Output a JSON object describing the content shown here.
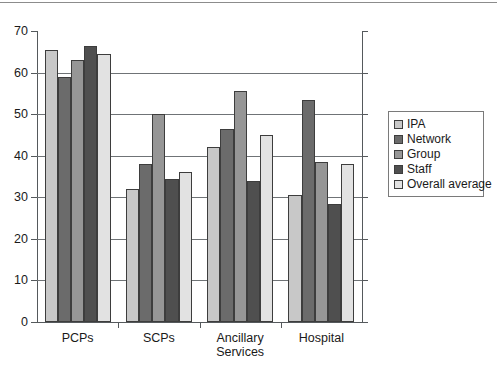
{
  "chart_data": {
    "type": "bar",
    "title": "",
    "xlabel": "",
    "ylabel": "",
    "ylim": [
      0,
      70
    ],
    "yticks": [
      0,
      10,
      20,
      30,
      40,
      50,
      60,
      70
    ],
    "grid": true,
    "legend_position": "right",
    "categories": [
      "PCPs",
      "SCPs",
      "Ancillary\nServices",
      "Hospital"
    ],
    "series": [
      {
        "name": "IPA",
        "color": "#c8c8c8",
        "values": [
          65.5,
          32.0,
          42.0,
          30.5
        ]
      },
      {
        "name": "Network",
        "color": "#6b6b6b",
        "values": [
          59.0,
          38.0,
          46.5,
          53.5
        ]
      },
      {
        "name": "Group",
        "color": "#969696",
        "values": [
          63.0,
          50.0,
          55.5,
          38.5
        ]
      },
      {
        "name": "Staff",
        "color": "#4f4f4f",
        "values": [
          66.5,
          34.5,
          34.0,
          28.5
        ]
      },
      {
        "name": "Overall average",
        "color": "#e2e2e2",
        "values": [
          64.5,
          36.0,
          45.0,
          38.0
        ]
      }
    ]
  },
  "legend": {
    "items": [
      {
        "label": "IPA"
      },
      {
        "label": "Network"
      },
      {
        "label": "Group"
      },
      {
        "label": "Staff"
      },
      {
        "label": "Overall average"
      }
    ]
  }
}
